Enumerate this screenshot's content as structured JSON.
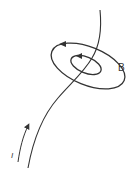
{
  "diagram": {
    "labels": {
      "field": "B",
      "current": "I"
    },
    "colors": {
      "stroke": "#333333",
      "background": "#ffffff"
    },
    "elements": {
      "wire": "current-carrying wire",
      "field_lines": [
        "outer field loop",
        "inner field loop"
      ],
      "current_arrow": "direction of current, upward along wire"
    }
  }
}
